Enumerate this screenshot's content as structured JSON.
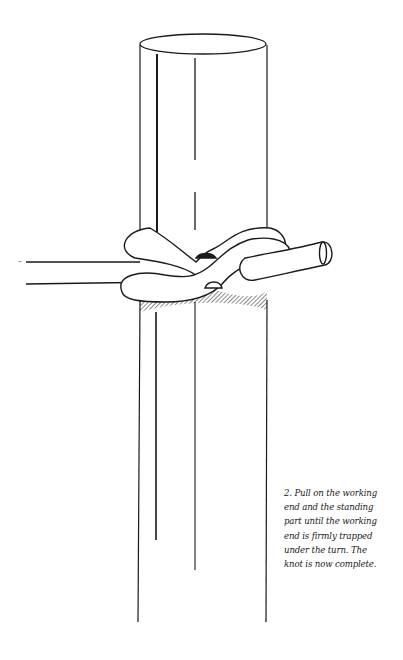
{
  "figure": {
    "step_number": "2.",
    "caption_lines": [
      "2. Pull on the working",
      "end and the standing",
      "part until the working",
      "end is firmly trapped",
      "under the turn. The",
      "knot is now complete."
    ],
    "colors": {
      "ink": "#1a1a1a",
      "paper": "#ffffff"
    }
  }
}
